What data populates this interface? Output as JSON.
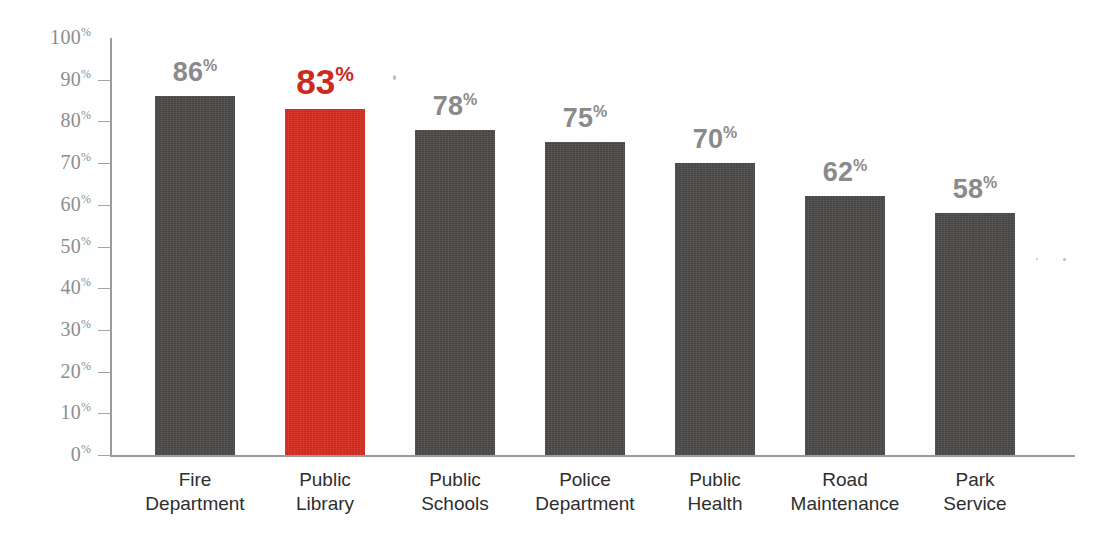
{
  "chart_data": {
    "type": "bar",
    "title": "",
    "subtitle": "",
    "xlabel": "",
    "ylabel": "",
    "ylim": [
      0,
      100
    ],
    "grid": false,
    "legend": "none",
    "categories": [
      "Fire\nDepartment",
      "Public\nLibrary",
      "Public\nSchools",
      "Police\nDepartment",
      "Public\nHealth",
      "Road\nMaintenance",
      "Park\nService"
    ],
    "values": [
      86,
      83,
      78,
      75,
      70,
      62,
      58
    ],
    "value_labels": [
      "86",
      "83",
      "78",
      "75",
      "70",
      "62",
      "58"
    ],
    "value_suffix": "%",
    "highlight_index": 1,
    "ytick_values": [
      100,
      90,
      80,
      70,
      60,
      50,
      40,
      30,
      20,
      10,
      0
    ],
    "ytick_labels": [
      "100",
      "90",
      "80",
      "70",
      "60",
      "50",
      "40",
      "30",
      "20",
      "10",
      "0"
    ],
    "ytick_suffix": "%"
  },
  "colors": {
    "bar": "#4d4b49",
    "bar_highlight": "#d62d1f",
    "label": "#8a8a8a",
    "label_highlight": "#cc2a1c",
    "axis": "#9a9a9a",
    "category_text": "#2e2e2e",
    "background": "#fefefe"
  }
}
